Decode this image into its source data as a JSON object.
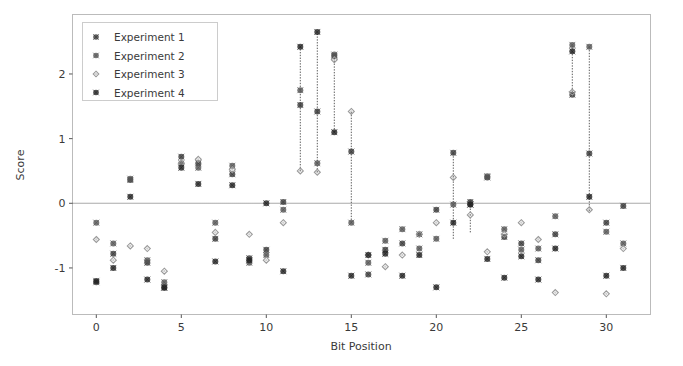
{
  "chart_data": {
    "type": "scatter",
    "title": "",
    "xlabel": "Bit Position",
    "ylabel": "Score",
    "xlim": [
      -1.4,
      32.6
    ],
    "ylim": [
      -1.72,
      2.92
    ],
    "xticks": [
      0,
      5,
      10,
      15,
      20,
      25,
      30
    ],
    "xticklabels": [
      "0",
      "5",
      "10",
      "15",
      "20",
      "25",
      "30"
    ],
    "yticks": [
      -1,
      0,
      1,
      2
    ],
    "yticklabels": [
      "-1",
      "0",
      "1",
      "2"
    ],
    "grid": false,
    "zero_line": 0,
    "legend_position": "upper left",
    "legend": [
      {
        "name": "Experiment 1",
        "marker": "circle",
        "color": "#3a3a3a"
      },
      {
        "name": "Experiment 2",
        "marker": "circle",
        "color": "#555555"
      },
      {
        "name": "Experiment 3",
        "marker": "diamond",
        "color": "#9a9a9a"
      },
      {
        "name": "Experiment 4",
        "marker": "circle",
        "color": "#222222"
      }
    ],
    "series": [
      {
        "name": "Experiment 1",
        "color": "#3a3a3a",
        "marker": "circle",
        "x": [
          0,
          1,
          2,
          3,
          4,
          5,
          6,
          7,
          8,
          9,
          10,
          11,
          12,
          13,
          14,
          15,
          16,
          17,
          18,
          19,
          20,
          21,
          22,
          23,
          24,
          25,
          26,
          27,
          28,
          29,
          30,
          31
        ],
        "values": [
          -1.22,
          -0.78,
          0.36,
          -0.92,
          -1.31,
          0.72,
          0.62,
          -0.55,
          0.45,
          -0.85,
          -0.72,
          0.02,
          1.52,
          1.42,
          2.28,
          0.8,
          -1.1,
          -0.72,
          -0.62,
          -0.48,
          -0.1,
          0.78,
          0.02,
          0.4,
          -0.52,
          -0.62,
          -0.88,
          -0.48,
          1.68,
          0.77,
          -0.3,
          -0.04
        ]
      },
      {
        "name": "Experiment 2",
        "color": "#555555",
        "marker": "circle",
        "x": [
          0,
          1,
          2,
          3,
          4,
          5,
          6,
          7,
          8,
          9,
          10,
          11,
          12,
          13,
          14,
          15,
          16,
          17,
          18,
          19,
          20,
          21,
          22,
          23,
          24,
          25,
          26,
          27,
          28,
          29,
          30,
          31
        ],
        "values": [
          -0.3,
          -0.62,
          0.38,
          -0.88,
          -1.22,
          0.62,
          0.55,
          -0.3,
          0.58,
          -0.92,
          -0.8,
          -0.1,
          1.75,
          0.62,
          2.3,
          -0.3,
          -0.92,
          -0.58,
          -0.4,
          -0.7,
          -0.55,
          -0.02,
          -0.02,
          0.42,
          -0.4,
          -0.72,
          -0.7,
          -0.2,
          2.45,
          2.42,
          -0.44,
          -0.62
        ]
      },
      {
        "name": "Experiment 3",
        "color": "#9a9a9a",
        "marker": "diamond",
        "x": [
          0,
          1,
          2,
          3,
          4,
          5,
          6,
          7,
          8,
          9,
          10,
          11,
          12,
          13,
          14,
          15,
          16,
          17,
          18,
          19,
          20,
          21,
          22,
          23,
          24,
          25,
          26,
          27,
          28,
          29,
          30,
          31
        ],
        "values": [
          -0.56,
          -0.88,
          -0.66,
          -0.7,
          -1.05,
          0.62,
          0.68,
          -0.45,
          0.52,
          -0.48,
          -0.88,
          -0.3,
          0.5,
          0.48,
          2.22,
          1.42,
          -0.8,
          -0.98,
          -0.8,
          -0.48,
          -0.3,
          0.4,
          -0.18,
          -0.75,
          -0.48,
          -0.3,
          -0.56,
          -1.38,
          1.72,
          -0.1,
          -1.4,
          -0.7
        ]
      },
      {
        "name": "Experiment 4",
        "color": "#222222",
        "marker": "circle",
        "x": [
          0,
          1,
          2,
          3,
          4,
          5,
          6,
          7,
          8,
          9,
          10,
          11,
          12,
          13,
          14,
          15,
          16,
          17,
          18,
          19,
          20,
          21,
          22,
          23,
          24,
          25,
          26,
          27,
          28,
          29,
          30,
          31
        ],
        "values": [
          -1.2,
          -1.0,
          0.1,
          -1.18,
          -1.3,
          0.55,
          0.3,
          -0.9,
          0.28,
          -0.88,
          0.0,
          -1.05,
          2.42,
          2.65,
          1.1,
          -1.12,
          -0.8,
          -0.78,
          -1.12,
          -0.8,
          -1.3,
          -0.3,
          -0.02,
          -0.86,
          -1.15,
          -0.82,
          -1.18,
          -0.7,
          2.35,
          0.1,
          -1.12,
          -1.0
        ]
      }
    ],
    "connectors": [
      {
        "x": 12,
        "y0": 0.5,
        "y1": 2.42
      },
      {
        "x": 13,
        "y0": 0.48,
        "y1": 2.65
      },
      {
        "x": 14,
        "y0": 1.1,
        "y1": 2.3
      },
      {
        "x": 15,
        "y0": -0.3,
        "y1": 1.42
      },
      {
        "x": 21,
        "y0": -0.55,
        "y1": 0.78
      },
      {
        "x": 22,
        "y0": -0.45,
        "y1": 0.05
      },
      {
        "x": 28,
        "y0": 1.68,
        "y1": 2.45
      },
      {
        "x": 29,
        "y0": -0.12,
        "y1": 2.42
      }
    ]
  }
}
